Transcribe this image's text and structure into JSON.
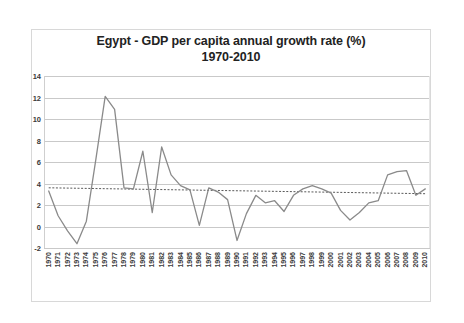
{
  "chart_data": {
    "type": "line",
    "title": "Egypt - GDP per capita annual growth rate (%)",
    "subtitle": "1970-2010",
    "title_line1": "Egypt - GDP per capita annual growth rate (%)",
    "title_line2": "1970-2010",
    "xlabel": "",
    "ylabel": "",
    "ylim": [
      -2,
      14
    ],
    "yticks": [
      14,
      12,
      10,
      8,
      6,
      4,
      2,
      0,
      -2
    ],
    "grid": true,
    "legend": "none",
    "line_color": "#808080",
    "trend_color": "#595959",
    "grid_color": "#c9c9c9",
    "categories": [
      "1970",
      "1971",
      "1972",
      "1973",
      "1974",
      "1975",
      "1976",
      "1977",
      "1978",
      "1979",
      "1980",
      "1981",
      "1982",
      "1983",
      "1984",
      "1985",
      "1986",
      "1987",
      "1988",
      "1989",
      "1990",
      "1991",
      "1992",
      "1993",
      "1994",
      "1995",
      "1996",
      "1997",
      "1998",
      "1999",
      "2000",
      "2001",
      "2002",
      "2003",
      "2004",
      "2005",
      "2006",
      "2007",
      "2008",
      "2009",
      "2010"
    ],
    "series": [
      {
        "name": "GDP per capita annual growth rate (%)",
        "values": [
          3.3,
          1.0,
          -0.4,
          -1.6,
          0.5,
          6.2,
          12.1,
          10.9,
          3.6,
          3.5,
          7.0,
          1.3,
          7.4,
          4.8,
          3.8,
          3.4,
          0.1,
          3.6,
          3.2,
          2.5,
          -1.3,
          1.2,
          2.9,
          2.2,
          2.4,
          1.4,
          2.9,
          3.5,
          3.8,
          3.5,
          3.1,
          1.5,
          0.6,
          1.3,
          2.2,
          2.4,
          4.8,
          5.1,
          5.2,
          2.9,
          3.5
        ]
      }
    ],
    "trendline": {
      "name": "linear trend",
      "style": "dotted",
      "start_value": 3.6,
      "end_value": 3.05
    }
  }
}
